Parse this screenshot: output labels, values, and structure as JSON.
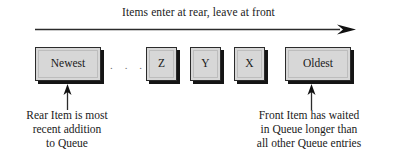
{
  "figure": {
    "background_color": "#ffffff",
    "ink_color": "#1a1a1a",
    "box_fill_color": "#d7d7d7",
    "box_border_color": "#2b2b2b",
    "box_shadow_color": "#151515"
  },
  "top_caption": {
    "text": "Items enter at rear, leave at front"
  },
  "flow_arrow": {
    "direction": "right",
    "label": "flow-direction-arrow"
  },
  "queue": {
    "boxes": [
      {
        "label": "Newest",
        "size": "wide"
      },
      {
        "label": "Z",
        "size": "small"
      },
      {
        "label": "Y",
        "size": "small"
      },
      {
        "label": "X",
        "size": "small"
      },
      {
        "label": "Oldest",
        "size": "wide"
      }
    ],
    "ellipsis": {
      "dots": [
        ".",
        ".",
        "."
      ]
    }
  },
  "callouts": {
    "rear": {
      "lines": [
        "Rear Item is most",
        "recent addition",
        "to Queue"
      ]
    },
    "front": {
      "lines": [
        "Front Item has waited",
        "in Queue longer than",
        "all other Queue entries"
      ]
    }
  }
}
